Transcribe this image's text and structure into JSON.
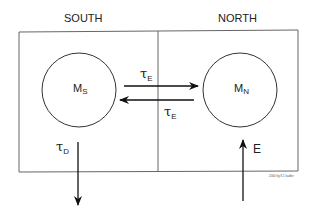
{
  "regions": {
    "south": {
      "title": "SOUTH",
      "reservoir": {
        "symbol": "M",
        "subscript": "S"
      }
    },
    "north": {
      "title": "NORTH",
      "reservoir": {
        "symbol": "M",
        "subscript": "N"
      }
    }
  },
  "fluxes": {
    "exchange_south_to_north": {
      "symbol": "τ",
      "subscript": "E"
    },
    "exchange_north_to_south": {
      "symbol": "τ",
      "subscript": "E"
    },
    "destruction": {
      "symbol": "τ",
      "subscript": "D"
    },
    "emission": {
      "symbol": "E"
    }
  },
  "credit": "2000 fig 8.1 kadler",
  "colors": {
    "line": "#222222",
    "box": "#666666",
    "background": "#ffffff"
  }
}
